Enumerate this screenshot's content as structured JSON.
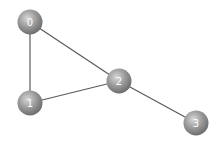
{
  "graph": {
    "type": "undirected",
    "nodes": [
      {
        "id": "0",
        "label": "0"
      },
      {
        "id": "1",
        "label": "1"
      },
      {
        "id": "2",
        "label": "2"
      },
      {
        "id": "3",
        "label": "3"
      }
    ],
    "edges": [
      {
        "source": "0",
        "target": "1"
      },
      {
        "source": "0",
        "target": "2"
      },
      {
        "source": "1",
        "target": "2"
      },
      {
        "source": "2",
        "target": "3"
      }
    ],
    "colors": {
      "node_highlight": "#d8d8d8",
      "node_base": "#9a9a9a",
      "node_shadow": "#6e6e6e",
      "edge": "#5a5a5a",
      "label": "#ffffff",
      "background": "#ffffff"
    }
  }
}
